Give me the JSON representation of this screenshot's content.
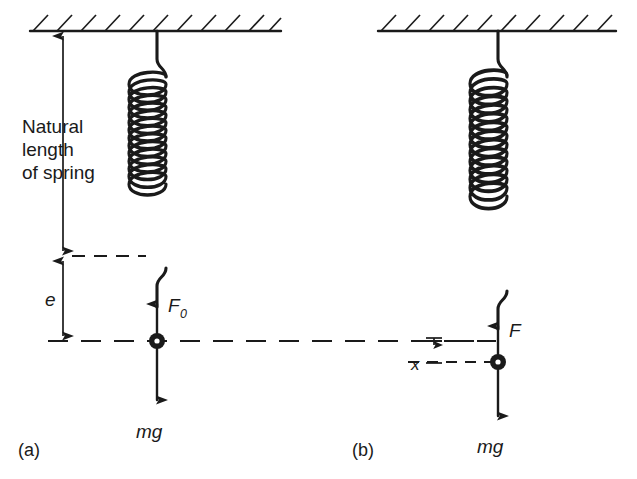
{
  "figure": {
    "background_color": "#ffffff",
    "ink_color": "#1a1a1a"
  },
  "labels": {
    "natural_length_line1": "Natural",
    "natural_length_line2": "length",
    "natural_length_line3": "of spring",
    "extension_e": "e",
    "displacement_x": "x",
    "force_F0_base": "F",
    "force_F0_sub": "0",
    "force_F": "F",
    "weight_a": "mg",
    "weight_b": "mg",
    "panel_a": "(a)",
    "panel_b": "(b)"
  },
  "panels": [
    {
      "id": "a",
      "caption": "(a)",
      "spring_coils": 13,
      "spring_state": "equilibrium extension e",
      "forces": [
        {
          "name": "spring-force",
          "symbol": "F0",
          "direction": "up"
        },
        {
          "name": "weight",
          "symbol": "mg",
          "direction": "down"
        }
      ],
      "measurements": [
        {
          "name": "natural-length",
          "symbol": "Natural length of spring",
          "direction": "double"
        },
        {
          "name": "extension",
          "symbol": "e",
          "direction": "double"
        }
      ]
    },
    {
      "id": "b",
      "caption": "(b)",
      "spring_coils": 15,
      "spring_state": "extended by further displacement x",
      "forces": [
        {
          "name": "spring-force",
          "symbol": "F",
          "direction": "up"
        },
        {
          "name": "weight",
          "symbol": "mg",
          "direction": "down"
        }
      ],
      "measurements": [
        {
          "name": "displacement",
          "symbol": "x",
          "direction": "double"
        }
      ]
    }
  ],
  "icons": {
    "ceiling": "hatched-ceiling-icon",
    "spring": "coil-spring-icon",
    "bob": "point-mass-icon",
    "arrow_up": "arrow-up-icon",
    "arrow_down": "arrow-down-icon",
    "dimension": "dimension-arrow-icon",
    "dashed_level": "dashed-level-line-icon"
  }
}
